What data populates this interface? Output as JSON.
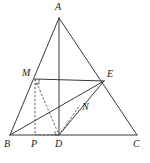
{
  "figure": {
    "type": "geometry-diagram",
    "stroke_color": "#3a3a3a",
    "dashed_color": "#4a4a4a",
    "background_color": "#ffffff",
    "label_color": "#1d1d1d",
    "points": [
      {
        "id": "A",
        "label": "A",
        "x": 59,
        "y": 18,
        "label_x": 55,
        "label_y": 2
      },
      {
        "id": "B",
        "label": "B",
        "x": 10,
        "y": 135,
        "label_x": 4,
        "label_y": 139
      },
      {
        "id": "C",
        "label": "C",
        "x": 137,
        "y": 135,
        "label_x": 133,
        "label_y": 139
      },
      {
        "id": "D",
        "label": "D",
        "x": 59,
        "y": 135,
        "label_x": 55,
        "label_y": 139
      },
      {
        "id": "P",
        "label": "P",
        "x": 35,
        "y": 135,
        "label_x": 31,
        "label_y": 139
      },
      {
        "id": "M",
        "label": "M",
        "x": 35,
        "y": 79,
        "label_x": 22,
        "label_y": 68
      },
      {
        "id": "E",
        "label": "E",
        "x": 104,
        "y": 81,
        "label_x": 107,
        "label_y": 69
      },
      {
        "id": "N",
        "label": "N",
        "x": 80,
        "y": 105,
        "label_x": 82,
        "label_y": 102
      }
    ],
    "solid_segments": [
      {
        "name": "side-AB",
        "from": "A",
        "to": "B"
      },
      {
        "name": "side-AC",
        "from": "A",
        "to": "C"
      },
      {
        "name": "side-BC",
        "from": "B",
        "to": "C"
      },
      {
        "name": "median-AD",
        "from": "A",
        "to": "D"
      },
      {
        "name": "segment-ME",
        "from": "M",
        "to": "E"
      },
      {
        "name": "segment-BE",
        "from": "B",
        "to": "E"
      },
      {
        "name": "segment-DE",
        "from": "D",
        "to": "E"
      }
    ],
    "dashed_segments": [
      {
        "name": "segment-MP",
        "from": "M",
        "to": "P"
      },
      {
        "name": "segment-MD",
        "from": "M",
        "to": "D"
      },
      {
        "name": "segment-PD",
        "from": "P",
        "to": "D"
      },
      {
        "name": "segment-DN",
        "from": "D",
        "to": "N"
      }
    ],
    "angle_marks": [
      {
        "name": "right-angle-at-M",
        "at": "M"
      },
      {
        "name": "right-angle-at-D",
        "at": "D"
      }
    ]
  }
}
